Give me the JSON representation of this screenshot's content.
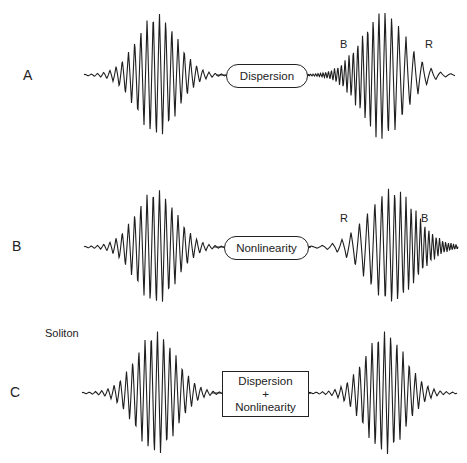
{
  "rows": [
    {
      "id": "A",
      "label": "A",
      "label_pos": [
        23,
        68
      ],
      "baseline_y": 75,
      "process": {
        "lines": [
          "Dispersion"
        ],
        "shape": "rounded",
        "box": [
          226,
          64,
          82,
          24
        ]
      },
      "input_pulse": {
        "x0": 84,
        "x1": 226,
        "center": 157,
        "amp": 62,
        "width": 20,
        "period": 6.2,
        "chirp": 0
      },
      "output_pulse": {
        "x0": 308,
        "x1": 455,
        "center": 383,
        "amp": 64,
        "width": 22,
        "period": 6.2,
        "chirp": 0.1
      },
      "annotations": [
        {
          "text": "B",
          "pos": [
            340,
            39
          ]
        },
        {
          "text": "R",
          "pos": [
            425,
            39
          ]
        }
      ]
    },
    {
      "id": "B",
      "label": "B",
      "label_pos": [
        12,
        239
      ],
      "baseline_y": 247,
      "process": {
        "lines": [
          "Nonlinearity"
        ],
        "shape": "rounded",
        "box": [
          224,
          236,
          85,
          24
        ]
      },
      "input_pulse": {
        "x0": 84,
        "x1": 224,
        "center": 156,
        "amp": 58,
        "width": 20,
        "period": 6.2,
        "chirp": 0
      },
      "output_pulse": {
        "x0": 309,
        "x1": 458,
        "center": 392,
        "amp": 58,
        "width": 24,
        "period": 6.2,
        "chirp": -0.1
      },
      "annotations": [
        {
          "text": "R",
          "pos": [
            340,
            213
          ]
        },
        {
          "text": "B",
          "pos": [
            421,
            213
          ]
        }
      ]
    },
    {
      "id": "C",
      "label": "C",
      "label_pos": [
        10,
        385
      ],
      "baseline_y": 393,
      "process": {
        "lines": [
          "Dispersion",
          "+",
          "Nonlinearity"
        ],
        "shape": "rect",
        "box": [
          222,
          371,
          87,
          46
        ]
      },
      "input_pulse": {
        "x0": 82,
        "x1": 222,
        "center": 156,
        "amp": 62,
        "width": 20,
        "period": 6.2,
        "chirp": 0
      },
      "output_pulse": {
        "x0": 309,
        "x1": 457,
        "center": 385,
        "amp": 62,
        "width": 20,
        "period": 6.2,
        "chirp": 0
      },
      "annotations": []
    }
  ],
  "soliton_label": {
    "text": "Soliton",
    "pos": [
      45,
      328
    ]
  },
  "colors": {
    "stroke": "#1f1f1f",
    "background": "#ffffff"
  }
}
